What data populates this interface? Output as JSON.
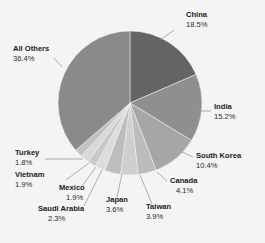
{
  "chart_data": {
    "type": "pie",
    "title": "",
    "subtitle": "",
    "xlabel": "",
    "ylabel": "",
    "legend_position": "none",
    "grid": false,
    "units": "percent",
    "start_angle_deg": 0,
    "direction": "clockwise",
    "categories": [
      "China",
      "India",
      "South Korea",
      "Canada",
      "Taiwan",
      "Japan",
      "Saudi Arabia",
      "Mexico",
      "Vietnam",
      "Turkey",
      "All Others"
    ],
    "values": [
      18.5,
      15.2,
      10.4,
      4.1,
      3.9,
      3.6,
      2.3,
      1.9,
      1.9,
      1.8,
      36.4
    ],
    "slices": [
      {
        "label": "China",
        "value": 18.5,
        "value_text": "18.5%",
        "color": "#646464"
      },
      {
        "label": "India",
        "value": 15.2,
        "value_text": "15.2%",
        "color": "#8f8f8f"
      },
      {
        "label": "South Korea",
        "value": 10.4,
        "value_text": "10.4%",
        "color": "#a6a6a6"
      },
      {
        "label": "Canada",
        "value": 4.1,
        "value_text": "4.1%",
        "color": "#bcbcbc"
      },
      {
        "label": "Taiwan",
        "value": 3.9,
        "value_text": "3.9%",
        "color": "#cfcfcf"
      },
      {
        "label": "Japan",
        "value": 3.6,
        "value_text": "3.6%",
        "color": "#bdbdbd"
      },
      {
        "label": "Saudi Arabia",
        "value": 2.3,
        "value_text": "2.3%",
        "color": "#dcdcdc"
      },
      {
        "label": "Mexico",
        "value": 1.9,
        "value_text": "1.9%",
        "color": "#c9c9c9"
      },
      {
        "label": "Vietnam",
        "value": 1.9,
        "value_text": "1.9%",
        "color": "#d8d8d8"
      },
      {
        "label": "Turkey",
        "value": 1.8,
        "value_text": "1.8%",
        "color": "#c2c2c2"
      },
      {
        "label": "All Others",
        "value": 36.4,
        "value_text": "36.4%",
        "color": "#8a8a8a"
      }
    ],
    "background_color": "#f4f4f4",
    "label_text_color": "#1b1b1b",
    "leader_line_color": "#9a9a9a"
  },
  "labels": {
    "china": {
      "name": "China",
      "value": "18.5%"
    },
    "india": {
      "name": "India",
      "value": "15.2%"
    },
    "south_korea": {
      "name": "South Korea",
      "value": "10.4%"
    },
    "canada": {
      "name": "Canada",
      "value": "4.1%"
    },
    "taiwan": {
      "name": "Taiwan",
      "value": "3.9%"
    },
    "japan": {
      "name": "Japan",
      "value": "3.6%"
    },
    "saudi_arabia": {
      "name": "Saudi Arabia",
      "value": "2.3%"
    },
    "mexico": {
      "name": "Mexico",
      "value": "1.9%"
    },
    "vietnam": {
      "name": "Vietnam",
      "value": "1.9%"
    },
    "turkey": {
      "name": "Turkey",
      "value": "1.8%"
    },
    "all_others": {
      "name": "All Others",
      "value": "36.4%"
    }
  }
}
